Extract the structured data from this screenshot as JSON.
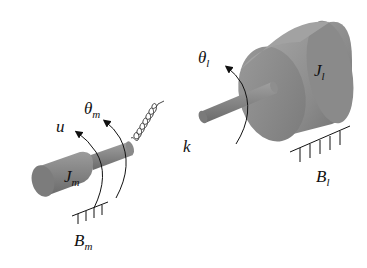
{
  "diagram": {
    "type": "two-mass torsional system",
    "components": {
      "motor_inertia": {
        "symbol": "J",
        "subscript": "m"
      },
      "load_inertia": {
        "symbol": "J",
        "subscript": "l"
      },
      "spring": {
        "symbol": "k"
      },
      "motor_angle": {
        "symbol": "θ",
        "subscript": "m"
      },
      "load_angle": {
        "symbol": "θ",
        "subscript": "l"
      },
      "input_torque": {
        "symbol": "u"
      },
      "motor_damping": {
        "symbol": "B",
        "subscript": "m"
      },
      "load_damping": {
        "symbol": "B",
        "subscript": "l"
      }
    }
  },
  "colors": {
    "cylinder_dark": "#6a6a6a",
    "cylinder_mid": "#8c8c8c",
    "cylinder_light": "#a8a8a8",
    "line": "#111111",
    "background": "#ffffff"
  }
}
